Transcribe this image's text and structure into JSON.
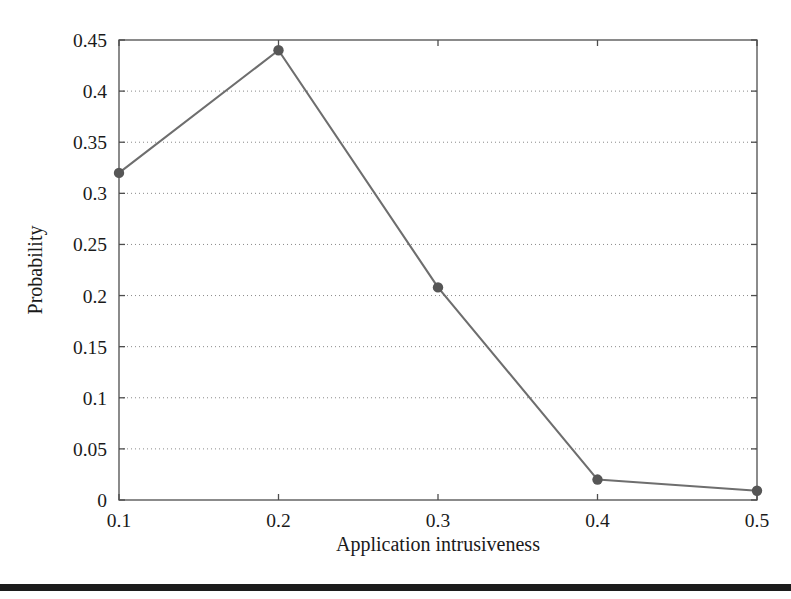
{
  "figure": {
    "background_color": "#ffffff",
    "bottom_rule": {
      "color": "#1c1c1c",
      "top": 584,
      "height": 7
    }
  },
  "chart_data": {
    "type": "line",
    "title": "",
    "subtitle": "",
    "xlabel": "Application intrusiveness",
    "ylabel": "Probability",
    "x": [
      0.1,
      0.2,
      0.3,
      0.4,
      0.5
    ],
    "values": [
      0.32,
      0.44,
      0.208,
      0.02,
      0.009
    ],
    "series": [
      {
        "name": "Probability",
        "x": [
          0.1,
          0.2,
          0.3,
          0.4,
          0.5
        ],
        "values": [
          0.32,
          0.44,
          0.208,
          0.02,
          0.009
        ]
      }
    ],
    "xlim": [
      0.1,
      0.5
    ],
    "ylim": [
      0,
      0.45
    ],
    "xticks": [
      0.1,
      0.2,
      0.3,
      0.4,
      0.5
    ],
    "xtick_labels": [
      "0.1",
      "0.2",
      "0.3",
      "0.4",
      "0.5"
    ],
    "yticks": [
      0,
      0.05,
      0.1,
      0.15,
      0.2,
      0.25,
      0.3,
      0.35,
      0.4,
      0.45
    ],
    "ytick_labels": [
      "0",
      "0.05",
      "0.1",
      "0.15",
      "0.2",
      "0.25",
      "0.3",
      "0.35",
      "0.4",
      "0.45"
    ],
    "grid": true,
    "grid_axis": "y",
    "grid_style": "dotted",
    "legend": false,
    "legend_position": "none",
    "line_color": "#6e6e6e",
    "marker_color": "#565656",
    "marker_style": "circle",
    "annotations": []
  },
  "plot_geometry": {
    "left": 119,
    "right": 757,
    "top": 40,
    "bottom": 500
  }
}
